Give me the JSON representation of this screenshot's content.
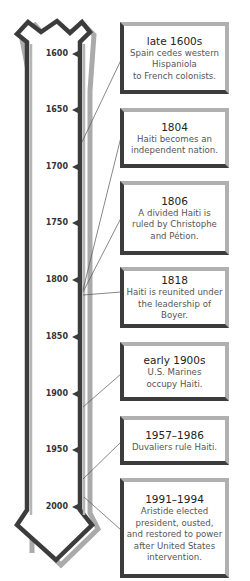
{
  "timeline": {
    "colors": {
      "bar_dark": "#3c3c3c",
      "bar_light": "#aaaaaa",
      "box_dark": "#3c3c3c",
      "box_light": "#b0b0b0"
    },
    "ticks": [
      {
        "label": "1600",
        "y": 54
      },
      {
        "label": "1650",
        "y": 110
      },
      {
        "label": "1700",
        "y": 167
      },
      {
        "label": "1750",
        "y": 223
      },
      {
        "label": "1800",
        "y": 280
      },
      {
        "label": "1850",
        "y": 337
      },
      {
        "label": "1900",
        "y": 394
      },
      {
        "label": "1950",
        "y": 450
      },
      {
        "label": "2000",
        "y": 507
      }
    ]
  },
  "events": [
    {
      "date": "late 1600s",
      "description": "Spain cedes western\nHispaniola\nto French colonists."
    },
    {
      "date": "1804",
      "description": "Haiti becomes an\nindependent nation."
    },
    {
      "date": "1806",
      "description": "A divided Haiti is\nruled by Christophe\nand Pétion."
    },
    {
      "date": "1818",
      "description": "Haiti is reunited under\nthe leadership of Boyer."
    },
    {
      "date": "early 1900s",
      "description": "U.S. Marines\noccupy Haiti."
    },
    {
      "date": "1957–1986",
      "description": "Duvaliers rule Haiti."
    },
    {
      "date": "1991–1994",
      "description": "Aristide elected\npresident, ousted,\nand restored to power\nafter United States\nintervention."
    }
  ]
}
